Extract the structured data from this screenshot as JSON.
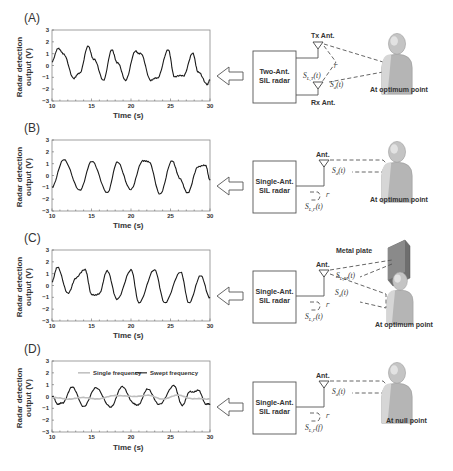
{
  "figure": {
    "panels": [
      {
        "id": "A",
        "label": "(A)",
        "radar_box": "Two-Ant. SIL radar",
        "radar_line1": "Two-Ant.",
        "radar_line2": "SIL radar",
        "tx_label": "Tx Ant.",
        "rx_label": "Rx Ant.",
        "signal_leak": "S_{L,T}(t)",
        "signal_leak_main": "S",
        "signal_leak_sub": "L,T",
        "signal_leak_tail": "(t)",
        "signal_target": "S_d(t)",
        "signal_target_main": "S",
        "signal_target_sub": "d",
        "signal_target_tail": "(t)",
        "gamma": "Γ",
        "position_label": "At optimum point"
      },
      {
        "id": "B",
        "label": "(B)",
        "radar_line1": "Single-Ant.",
        "radar_line2": "SIL radar",
        "ant_label": "Ant.",
        "signal_target_main": "S",
        "signal_target_sub": "d",
        "signal_target_tail": "(t)",
        "signal_leak_main": "S",
        "signal_leak_sub": "L,Γ",
        "signal_leak_tail": "(t)",
        "gamma": "Γ",
        "position_label": "At optimum point"
      },
      {
        "id": "C",
        "label": "(C)",
        "radar_line1": "Single-Ant.",
        "radar_line2": "SIL radar",
        "ant_label": "Ant.",
        "plate_label": "Metal plate",
        "signal_metal_main": "S",
        "signal_metal_sub": "L,M",
        "signal_metal_tail": "(t)",
        "signal_target_main": "S",
        "signal_target_sub": "d",
        "signal_target_tail": "(t)",
        "signal_leak_main": "S",
        "signal_leak_sub": "L,Γ",
        "signal_leak_tail": "(t)",
        "gamma": "Γ",
        "position_label": "At optimum point"
      },
      {
        "id": "D",
        "label": "(D)",
        "radar_line1": "Single-Ant.",
        "radar_line2": "SIL radar",
        "ant_label": "Ant.",
        "signal_target_main": "S",
        "signal_target_sub": "d",
        "signal_target_tail": "(t)",
        "signal_leak_main": "S",
        "signal_leak_sub": "L,Γ",
        "signal_leak_tail": "(f)",
        "gamma": "Γ",
        "position_label": "At null point",
        "legend": [
          "Single frequency",
          "Swept frequency"
        ]
      }
    ],
    "colors": {
      "trace": "#1a1a1a",
      "single_freq_trace": "#bdbdbd",
      "axis": "#555555",
      "dash": "#555555",
      "person": "#b8b8b8"
    }
  },
  "chart_data": [
    {
      "panel": "A",
      "type": "line",
      "title": "",
      "xlabel": "Time (s)",
      "ylabel": "Radar detection output (V)",
      "xlim": [
        10,
        30
      ],
      "ylim": [
        -3,
        3
      ],
      "xticks": [
        10,
        15,
        20,
        25,
        30
      ],
      "yticks": [
        -3,
        -2,
        -1,
        0,
        1,
        2,
        3
      ],
      "series": [
        {
          "name": "Output",
          "x": [
            10,
            10.8,
            11.5,
            12.8,
            13.5,
            14.6,
            15.3,
            16.5,
            17.6,
            18.3,
            19.3,
            20.6,
            21.2,
            22.5,
            23.3,
            24.7,
            25.5,
            26.6,
            27.8,
            28.5,
            29.6,
            30
          ],
          "values": [
            0.3,
            1.5,
            0.9,
            -1.1,
            -0.6,
            1.6,
            0.5,
            -1.2,
            1.3,
            0.2,
            -1.2,
            1.2,
            1.0,
            -1.2,
            -1.1,
            1.3,
            -0.9,
            -0.9,
            1.0,
            -0.5,
            -1.6,
            -1.2
          ]
        }
      ]
    },
    {
      "panel": "B",
      "type": "line",
      "title": "",
      "xlabel": "Time (s)",
      "ylabel": "Radar detection output (V)",
      "xlim": [
        10,
        30
      ],
      "ylim": [
        -3,
        3
      ],
      "xticks": [
        10,
        15,
        20,
        25,
        30
      ],
      "yticks": [
        -3,
        -2,
        -1,
        0,
        1,
        2,
        3
      ],
      "series": [
        {
          "name": "Output",
          "x": [
            10,
            11.5,
            13.5,
            15,
            17,
            18.3,
            20,
            21.5,
            22.3,
            23.7,
            25.2,
            26.2,
            27.2,
            28.5,
            29.5,
            30
          ],
          "values": [
            -1,
            1.4,
            -1.3,
            1.2,
            -1.4,
            1.1,
            -1.2,
            1.3,
            1.1,
            -1.6,
            1.3,
            -0.3,
            -1.5,
            0.8,
            0.8,
            -0.4
          ]
        }
      ]
    },
    {
      "panel": "C",
      "type": "line",
      "title": "",
      "xlabel": "Time (s)",
      "ylabel": "Radar detection output (V)",
      "xlim": [
        10,
        30
      ],
      "ylim": [
        -3,
        3
      ],
      "xticks": [
        10,
        15,
        20,
        25,
        30
      ],
      "yticks": [
        -3,
        -2,
        -1,
        0,
        1,
        2,
        3
      ],
      "series": [
        {
          "name": "Output",
          "x": [
            10,
            10.7,
            12,
            13,
            14.2,
            15,
            16,
            17,
            18.2,
            20,
            21,
            23,
            24.3,
            26.3,
            27.3,
            28.8,
            30
          ],
          "values": [
            0.3,
            1.6,
            -0.7,
            0.6,
            1.4,
            -0.8,
            -0.7,
            1.3,
            -1.2,
            1.3,
            -1.4,
            1.3,
            -1.5,
            1.2,
            -1.5,
            0.8,
            -1
          ]
        }
      ]
    },
    {
      "panel": "D",
      "type": "line",
      "title": "",
      "xlabel": "Time (s)",
      "ylabel": "Radar detection output (V)",
      "xlim": [
        10,
        30
      ],
      "ylim": [
        -3,
        3
      ],
      "xticks": [
        10,
        15,
        20,
        25,
        30
      ],
      "yticks": [
        -3,
        -2,
        -1,
        0,
        1,
        2,
        3
      ],
      "legend_position": "top",
      "series": [
        {
          "name": "Swept frequency",
          "x": [
            10,
            10.7,
            11.3,
            12.5,
            14,
            15.6,
            17.5,
            18.9,
            20.3,
            21,
            22.1,
            23.5,
            25.4,
            26.5,
            27.5,
            28.5,
            29.5,
            30
          ],
          "values": [
            0,
            -0.6,
            -0.6,
            0.8,
            -0.8,
            0.7,
            -0.9,
            0.9,
            -0.6,
            -0.7,
            0.7,
            -0.7,
            0.9,
            -0.7,
            0.4,
            0.5,
            -0.6,
            -0.7
          ]
        },
        {
          "name": "Single frequency",
          "x": [
            10,
            12,
            14,
            16,
            18,
            20,
            22,
            24,
            26,
            28,
            30
          ],
          "values": [
            -0.1,
            -0.2,
            -0.1,
            -0.2,
            0.1,
            0.0,
            0.1,
            -0.2,
            0.1,
            -0.2,
            -0.2
          ]
        }
      ]
    }
  ]
}
